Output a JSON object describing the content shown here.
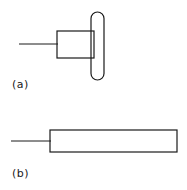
{
  "figure": {
    "type": "technical-line-drawing",
    "background_color": "#ffffff",
    "stroke_color": "#1a1a1a",
    "width": 187,
    "height": 190,
    "panels": [
      {
        "id": "a",
        "label": "(a)",
        "label_x": 12,
        "label_y": 88,
        "description": "Side view of a probe: thin lead wire entering a short rectangular body, with a tall rounded-end vertical element overlapping its right end",
        "parts": [
          {
            "name": "lead-wire",
            "shape": "line",
            "x1": 19,
            "y1": 44,
            "x2": 58,
            "y2": 44,
            "stroke_width": 1
          },
          {
            "name": "body-rectangle",
            "shape": "rect",
            "x": 57,
            "y": 31,
            "width": 37,
            "height": 27,
            "stroke_width": 1.2
          },
          {
            "name": "vertical-rounded-element",
            "shape": "rounded-rect",
            "x": 91,
            "y": 12,
            "width": 13,
            "height": 68,
            "corner_radius": 6.5,
            "stroke_width": 1.2
          }
        ]
      },
      {
        "id": "b",
        "label": "(b)",
        "label_x": 12,
        "label_y": 177,
        "description": "Side view of an elongated probe: thin lead wire entering a long shallow rectangular body",
        "parts": [
          {
            "name": "lead-wire",
            "shape": "line",
            "x1": 11,
            "y1": 141,
            "x2": 51,
            "y2": 141,
            "stroke_width": 1
          },
          {
            "name": "body-rectangle",
            "shape": "rect",
            "x": 50,
            "y": 130,
            "width": 127,
            "height": 22,
            "stroke_width": 1.2
          }
        ]
      }
    ]
  }
}
